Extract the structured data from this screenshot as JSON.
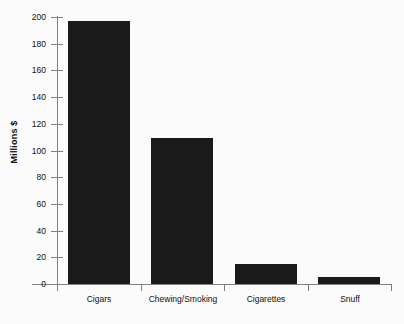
{
  "chart_data": {
    "type": "bar",
    "title": "",
    "subtitle": "",
    "xlabel": "",
    "ylabel": "Millions $",
    "categories": [
      "Cigars",
      "Chewing/Smoking",
      "Cigarettes",
      "Snuff"
    ],
    "values": [
      197,
      109,
      15,
      5
    ],
    "series": [
      {
        "name": "Millions $",
        "values": [
          197,
          109,
          15,
          5
        ]
      }
    ],
    "ylim": [
      0,
      200
    ],
    "y_ticks": [
      0,
      20,
      40,
      60,
      80,
      100,
      120,
      140,
      160,
      180,
      200
    ],
    "y_tick_labels": [
      "0",
      "20",
      "40",
      "60",
      "80",
      "100",
      "120",
      "140",
      "160",
      "180",
      "200"
    ],
    "grid": false,
    "legend": false,
    "legend_position": "none",
    "annotations": [],
    "colors": {
      "bar": "#1a1a1a",
      "axis": "#808080",
      "text": "#111111",
      "background": "#fbfbfb"
    }
  }
}
